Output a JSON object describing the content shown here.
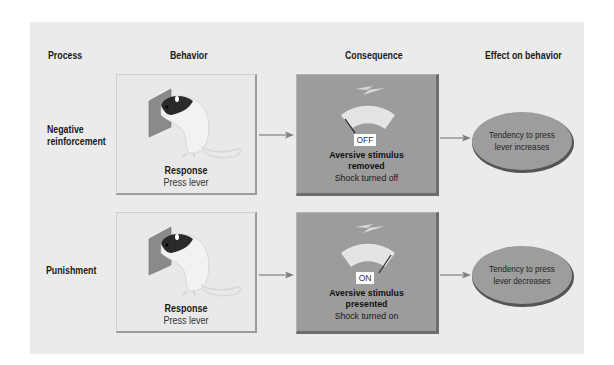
{
  "headers": {
    "process": "Process",
    "behavior": "Behavior",
    "consequence": "Consequence",
    "effect": "Effect on behavior"
  },
  "rows": [
    {
      "process_line1": "Negative",
      "process_line2": "reinforcement",
      "behavior": {
        "title": "Response",
        "subtitle": "Press lever",
        "image": "rat-pressing-lever"
      },
      "consequence": {
        "state": "OFF",
        "gauge_needle": "left",
        "title_line1": "Aversive stimulus",
        "title_line2": "removed",
        "subtitle": "Shock turned off",
        "icon": "lightning-bolt-icon"
      },
      "effect": {
        "line1": "Tendency to press",
        "line2": "lever increases"
      }
    },
    {
      "process_line1": "Punishment",
      "process_line2": "",
      "behavior": {
        "title": "Response",
        "subtitle": "Press lever",
        "image": "rat-pressing-lever"
      },
      "consequence": {
        "state": "ON",
        "gauge_needle": "right",
        "title_line1": "Aversive stimulus",
        "title_line2": "presented",
        "subtitle": "Shock turned on",
        "icon": "lightning-bolt-icon"
      },
      "effect": {
        "line1": "Tendency to press",
        "line2": "lever decreases"
      }
    }
  ],
  "colors": {
    "panel_bg": "#ebebeb",
    "consequence_fill": "#9c9c9c",
    "ellipse_fill": "#9d9d9d",
    "arrow": "#808080",
    "lever": "#8a8a8a"
  }
}
